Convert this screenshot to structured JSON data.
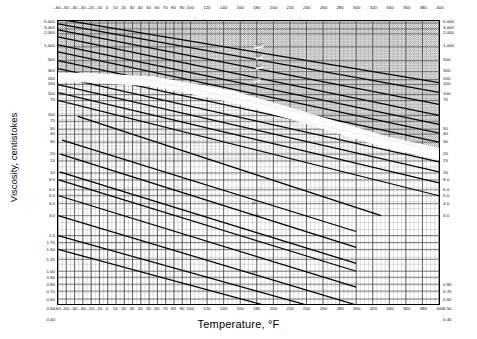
{
  "chart_data": {
    "type": "line",
    "title": "",
    "xlabel": "Temperature, °F",
    "ylabel": "Viscosity, centistokes",
    "xlim": [
      -60,
      400
    ],
    "ylim": [
      0.4,
      5000
    ],
    "yscale": "ASTM double-log",
    "xscale": "linear",
    "grid": true,
    "legend": "none",
    "x_ticks": [
      -60,
      -50,
      -40,
      -30,
      -20,
      -10,
      0,
      10,
      20,
      30,
      40,
      50,
      60,
      70,
      80,
      90,
      100,
      120,
      140,
      160,
      180,
      200,
      220,
      240,
      260,
      280,
      300,
      320,
      340,
      360,
      380,
      400
    ],
    "x_ticks_top": [
      -60,
      -50,
      -40,
      -30,
      -20,
      -10,
      0,
      10,
      20,
      30,
      40,
      50,
      60,
      70,
      80,
      90,
      100,
      120,
      140,
      160,
      180,
      200,
      220,
      240,
      260,
      280,
      300,
      320,
      340,
      360,
      380,
      400
    ],
    "y_ticks_left": [
      "5,000",
      "3,000",
      "2,000",
      "1,000",
      "500",
      "300",
      "200",
      "150",
      "100",
      "75",
      "50",
      "40",
      "30",
      "20",
      "15",
      "10",
      "8.0",
      "6.0",
      "5.0",
      "4.0",
      "3.0",
      "2.0",
      "1.75",
      "1.50",
      "1.25",
      "1.00",
      "0.90",
      "0.80",
      "0.70",
      "0.60",
      "0.50",
      "0.40"
    ],
    "y_ticks_right": [
      "5,000",
      "3,000",
      "2,000",
      "1,000",
      "500",
      "300",
      "200",
      "150",
      "100",
      "75",
      "50",
      "40",
      "30",
      "20",
      "15",
      "10",
      "8.0",
      "6.0",
      "5.0",
      "4.0",
      "3.0",
      "0.80",
      "0.70",
      "0.60",
      "0.50",
      "0.40"
    ],
    "series": [
      {
        "name": "1500",
        "label": "1500",
        "values": []
      },
      {
        "name": "1000",
        "label": "1000",
        "values": []
      },
      {
        "name": "680",
        "label": "680",
        "values": []
      },
      {
        "name": "460",
        "label": "460",
        "values": []
      },
      {
        "name": "320",
        "label": "320",
        "values": []
      },
      {
        "name": "220",
        "label": "220",
        "values": []
      },
      {
        "name": "150",
        "label": "150",
        "values": []
      },
      {
        "name": "100",
        "label": "100",
        "values": []
      },
      {
        "name": "68",
        "label": "68",
        "values": []
      },
      {
        "name": "46",
        "label": "46",
        "values": []
      },
      {
        "name": "32",
        "label": "32",
        "values": []
      },
      {
        "name": "22",
        "label": "22",
        "values": []
      },
      {
        "name": "15",
        "label": "15",
        "values": []
      },
      {
        "name": "10",
        "label": "10",
        "values": []
      },
      {
        "name": "7",
        "label": "7",
        "values": []
      },
      {
        "name": "5",
        "label": "5",
        "values": []
      },
      {
        "name": "3",
        "label": "3",
        "values": []
      },
      {
        "name": "2",
        "label": "2",
        "values": []
      }
    ],
    "curve_labels": [
      {
        "text": "1000",
        "x": 258,
        "y": 45
      },
      {
        "text": "680",
        "x": 258,
        "y": 56
      },
      {
        "text": "460",
        "x": 258,
        "y": 66
      },
      {
        "text": "320",
        "x": 256,
        "y": 79
      },
      {
        "text": "15",
        "x": 253,
        "y": 203
      },
      {
        "text": "10",
        "x": 256,
        "y": 215
      },
      {
        "text": "7",
        "x": 253,
        "y": 240
      },
      {
        "text": "0.85",
        "x": 253,
        "y": 272
      }
    ],
    "shaded_band": {
      "present": true,
      "description": "dark halftone region upper-right of diagonal white band"
    }
  },
  "axes": {
    "y_title": "Viscosity, centistokes",
    "x_title": "Temperature, °F"
  }
}
